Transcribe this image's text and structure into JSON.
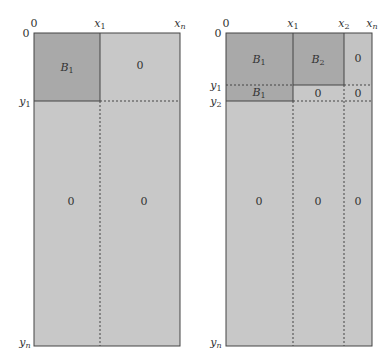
{
  "colors": {
    "block_dark": "#a9a9a9",
    "block_mid": "#b9b9b9",
    "zero_light": "#c8c8c8",
    "line": "#444444"
  },
  "left_panel": {
    "axis_top": {
      "origin": "0",
      "x1": "x",
      "x1_sub": "1",
      "xn": "x",
      "xn_sub": "n"
    },
    "axis_left": {
      "origin": "0",
      "y1": "y",
      "y1_sub": "1",
      "yn": "y",
      "yn_sub": "n"
    },
    "cells": {
      "top_left": {
        "label": "B",
        "sub": "1"
      },
      "top_right": {
        "label": "0"
      },
      "bottom_left": {
        "label": "0"
      },
      "bottom_right": {
        "label": "0"
      }
    }
  },
  "right_panel": {
    "axis_top": {
      "origin": "0",
      "x1": "x",
      "x1_sub": "1",
      "x2": "x",
      "x2_sub": "2",
      "xn": "x",
      "xn_sub": "n"
    },
    "axis_left": {
      "origin": "0",
      "y1": "y",
      "y1_sub": "1",
      "y2": "y",
      "y2_sub": "2",
      "yn": "y",
      "yn_sub": "n"
    },
    "cells": {
      "top_b1": {
        "label": "B",
        "sub": "1"
      },
      "top_b2": {
        "label": "B",
        "sub": "2"
      },
      "top_zero": {
        "label": "0"
      },
      "strip_b1": {
        "label": "B",
        "sub": "1"
      },
      "strip_zero_mid": {
        "label": "0"
      },
      "strip_zero_right": {
        "label": "0"
      },
      "bottom_left": {
        "label": "0"
      },
      "bottom_mid": {
        "label": "0"
      },
      "bottom_right": {
        "label": "0"
      }
    }
  }
}
